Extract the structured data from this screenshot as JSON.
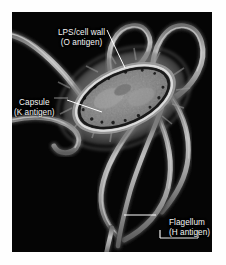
{
  "figure": {
    "kind": "electron-micrograph",
    "background_color": "#ffffff",
    "panel_color": "#050505",
    "label_color": "#f4f4f4",
    "structure_color": "#a9a9a9"
  },
  "annotations": [
    {
      "id": "lps",
      "line1": "LPS/cell wall",
      "line2": "(O antigen)",
      "leader": "diagonal line from label down-right to cell wall"
    },
    {
      "id": "capsule",
      "line1": "Capsule",
      "line2": "(K antigen)",
      "leader": "line from label up-right to capsule layer"
    },
    {
      "id": "flagellum",
      "line1": "Flagellum",
      "line2": "(H antigen)",
      "leader": "horizontal line from label left to flagellum strand"
    }
  ],
  "scale_bar": {
    "label": "",
    "present": true
  }
}
